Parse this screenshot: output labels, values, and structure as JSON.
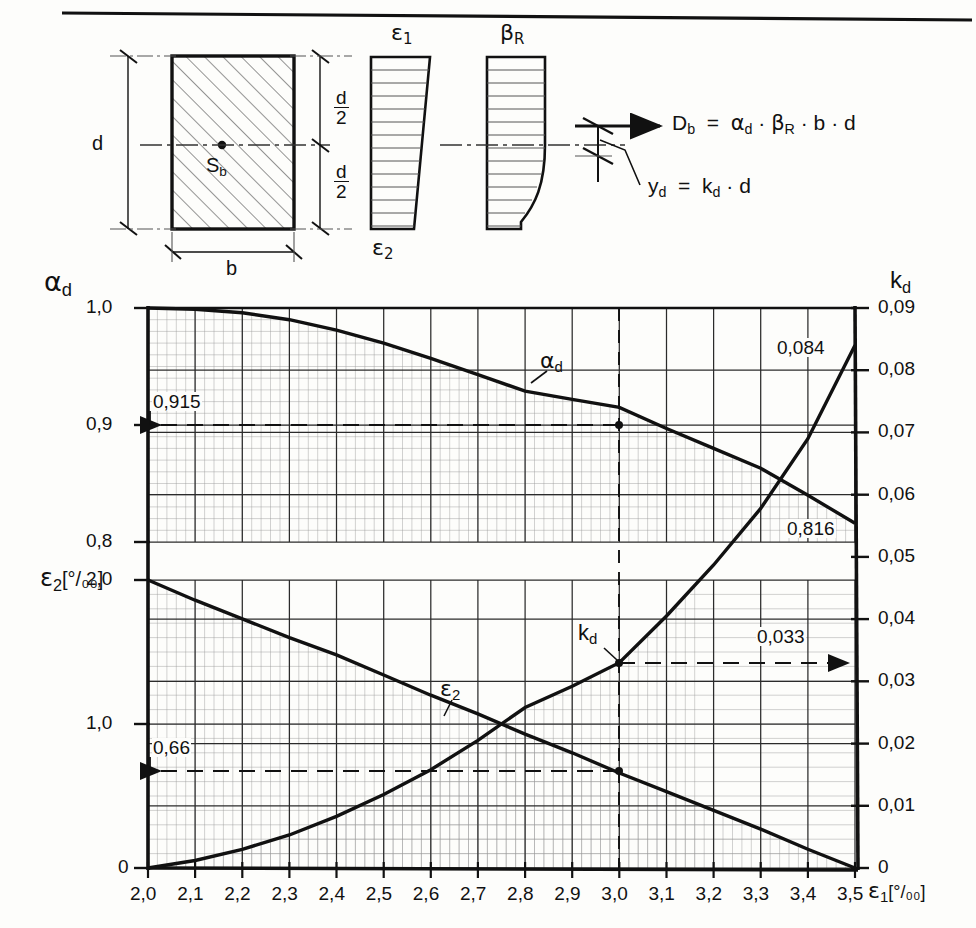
{
  "page": {
    "has_top_rule": true,
    "background": "#fdfdfb",
    "ink": "#111111"
  },
  "diagram": {
    "title_parts": [
      "cross-section",
      "strain diagram",
      "stress block"
    ],
    "section": {
      "label_depth": "d",
      "label_width": "b",
      "centroid_label": "S",
      "centroid_sub": "b",
      "half_depth_numerator": "d",
      "half_depth_denominator": "2",
      "hatched": true
    },
    "strain_block": {
      "top_label": "ε",
      "top_sub": "1",
      "bottom_label": "ε",
      "bottom_sub": "2"
    },
    "stress_block": {
      "label": "β",
      "label_sub": "R"
    },
    "formulas": [
      {
        "id": "compression-force",
        "text": "D",
        "sub": "b",
        "rhs": "= α · β · b · d",
        "full": "D_b = α_d · β_R · b · d"
      },
      {
        "id": "lever-arm",
        "text": "y",
        "sub": "d",
        "rhs": "= k · d",
        "full": "y_d = k_d · d"
      }
    ],
    "formula_tokens": {
      "Db": "D",
      "Db_sub": "b",
      "eq": "=",
      "alpha": "α",
      "alpha_sub": "d",
      "dot": "·",
      "beta": "β",
      "beta_sub": "R",
      "b": "b",
      "d": "d",
      "yd": "y",
      "yd_sub": "d",
      "kd": "k",
      "kd_sub": "d"
    }
  },
  "chart_data": {
    "type": "line",
    "title": "",
    "xlabel": "ε₁ [°/₀₀]",
    "xlabel_base": "ε",
    "xlabel_sub": "1",
    "xlabel_unit": "[°/₀₀]",
    "xlim": [
      2.0,
      3.5
    ],
    "x_ticks": [
      "2,0",
      "2,1",
      "2,2",
      "2,3",
      "2,4",
      "2,5",
      "2,6",
      "2,7",
      "2,8",
      "2,9",
      "3,0",
      "3,1",
      "3,2",
      "3,3",
      "3,4",
      "3,5"
    ],
    "x_tick_values": [
      2.0,
      2.1,
      2.2,
      2.3,
      2.4,
      2.5,
      2.6,
      2.7,
      2.8,
      2.9,
      3.0,
      3.1,
      3.2,
      3.3,
      3.4,
      3.5
    ],
    "grid": true,
    "grid_minor_divisions": 5,
    "legend": "none",
    "axes": [
      {
        "id": "alpha-axis",
        "side": "left-upper",
        "name": "α",
        "name_sub": "d",
        "ylim": [
          0.8,
          1.0
        ],
        "ticks": [
          "1,0",
          "0,9",
          "0,8"
        ],
        "tick_values": [
          1.0,
          0.9,
          0.8
        ]
      },
      {
        "id": "eps2-axis",
        "side": "left-lower",
        "name": "ε",
        "name_sub": "2",
        "unit": "[°/₀₀]",
        "ylim": [
          0,
          2.0
        ],
        "ticks": [
          "2,0",
          "1,0",
          "0"
        ],
        "tick_values": [
          2.0,
          1.0,
          0.0
        ]
      },
      {
        "id": "kd-axis",
        "side": "right",
        "name": "k",
        "name_sub": "d",
        "ylim": [
          0,
          0.09
        ],
        "ticks": [
          "0,09",
          "0,08",
          "0,07",
          "0,06",
          "0,05",
          "0,04",
          "0,03",
          "0,02",
          "0,01",
          "0"
        ],
        "tick_values": [
          0.09,
          0.08,
          0.07,
          0.06,
          0.05,
          0.04,
          0.03,
          0.02,
          0.01,
          0
        ]
      }
    ],
    "series": [
      {
        "name": "α",
        "name_sub": "d",
        "label": "α_d",
        "axis": "alpha-axis",
        "x": [
          2.0,
          2.1,
          2.2,
          2.3,
          2.4,
          2.5,
          2.6,
          2.7,
          2.8,
          2.9,
          3.0,
          3.1,
          3.2,
          3.3,
          3.4,
          3.5
        ],
        "values": [
          1.0,
          0.999,
          0.996,
          0.99,
          0.981,
          0.97,
          0.957,
          0.943,
          0.929,
          0.922,
          0.915,
          0.897,
          0.88,
          0.863,
          0.84,
          0.816
        ]
      },
      {
        "name": "ε",
        "name_sub": "2",
        "label": "ε_2",
        "axis": "eps2-axis",
        "x": [
          2.0,
          2.1,
          2.2,
          2.3,
          2.4,
          2.5,
          2.6,
          2.7,
          2.8,
          2.9,
          3.0,
          3.1,
          3.2,
          3.3,
          3.4,
          3.5
        ],
        "values": [
          2.0,
          1.86,
          1.73,
          1.6,
          1.48,
          1.34,
          1.2,
          1.07,
          0.93,
          0.8,
          0.66,
          0.53,
          0.4,
          0.27,
          0.13,
          0.0
        ]
      },
      {
        "name": "k",
        "name_sub": "d",
        "label": "k_d",
        "axis": "kd-axis",
        "x": [
          2.0,
          2.1,
          2.2,
          2.3,
          2.4,
          2.5,
          2.6,
          2.7,
          2.8,
          2.9,
          3.0,
          3.1,
          3.2,
          3.3,
          3.4,
          3.5
        ],
        "values": [
          0.0,
          0.0012,
          0.003,
          0.0053,
          0.0083,
          0.0118,
          0.0158,
          0.0205,
          0.0258,
          0.0292,
          0.033,
          0.0405,
          0.0487,
          0.0578,
          0.069,
          0.084
        ]
      }
    ],
    "annotations": [
      {
        "id": "alpha-read",
        "text": "0,915",
        "value": 0.915,
        "axis": "alpha-axis",
        "at_x": 3.0,
        "arrow": "left"
      },
      {
        "id": "eps2-read",
        "text": "0,66",
        "value": 0.66,
        "axis": "eps2-axis",
        "at_x": 3.0,
        "arrow": "left"
      },
      {
        "id": "kd-read",
        "text": "0,033",
        "value": 0.033,
        "axis": "kd-axis",
        "at_x": 3.0,
        "arrow": "right"
      },
      {
        "id": "alpha-end",
        "text": "0,084",
        "value": 0.084,
        "axis": "kd-axis",
        "at_x": 3.5,
        "arrow": "none"
      },
      {
        "id": "kd-end",
        "text": "0,816",
        "value": 0.816,
        "axis": "alpha-axis",
        "at_x": 3.5,
        "arrow": "none"
      }
    ],
    "curve_labels": [
      {
        "id": "alpha-curve-label",
        "base": "α",
        "sub": "d"
      },
      {
        "id": "eps2-curve-label",
        "base": "ε",
        "sub": "2"
      },
      {
        "id": "kd-curve-label",
        "base": "k",
        "sub": "d"
      }
    ],
    "reference_line": {
      "x": 3.0,
      "style": "dashed"
    }
  }
}
